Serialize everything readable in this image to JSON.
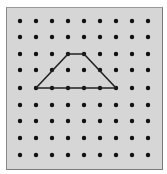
{
  "geoboard": {
    "columns": 9,
    "rows": 9,
    "dot_x": [
      20,
      36,
      52,
      68,
      84,
      100,
      116,
      132,
      148
    ],
    "dot_y": [
      21,
      37,
      54,
      70,
      88,
      105,
      121,
      138,
      155
    ],
    "background_color": "#d6d6d6",
    "dot_color": "#111111",
    "line_color": "#222222"
  },
  "shape": {
    "type": "trapezoid",
    "vertices": [
      [
        3,
        2
      ],
      [
        4,
        2
      ],
      [
        6,
        4
      ],
      [
        1,
        4
      ]
    ]
  }
}
